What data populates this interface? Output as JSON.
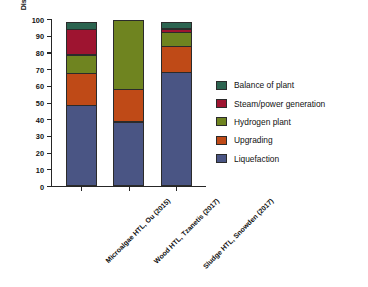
{
  "chart_data": {
    "type": "bar",
    "variant": "stacked-vertical",
    "title": "",
    "xlabel": "",
    "ylabel": "Distribution of Total Capital Investment (%)",
    "ylim": [
      0,
      100
    ],
    "yticks": [
      0,
      10,
      20,
      30,
      40,
      50,
      60,
      70,
      80,
      90,
      100
    ],
    "ytick_labels": [
      "0",
      "10",
      "20",
      "30",
      "40",
      "50",
      "60",
      "70",
      "80",
      "90",
      "100"
    ],
    "grid": false,
    "legend_position": "right",
    "categories": [
      "Microalgae HTL, Ou (2015)",
      "Wood HTL, Tzanetis (2017)",
      "Sludge HTL, Snowden (2017)"
    ],
    "series": [
      {
        "name": "Liquefaction",
        "color": "#4a5584",
        "values": [
          48.5,
          38.5,
          68.0
        ]
      },
      {
        "name": "Upgrading",
        "color": "#bf4a17",
        "values": [
          19.5,
          20.0,
          16.0
        ]
      },
      {
        "name": "Hydrogen plant",
        "color": "#6f8420",
        "values": [
          11.5,
          41.5,
          9.0
        ]
      },
      {
        "name": "Steam/power generation",
        "color": "#9e1430",
        "values": [
          15.5,
          0.0,
          2.5
        ]
      },
      {
        "name": "Balance of plant",
        "color": "#2c6450",
        "values": [
          5.0,
          0.0,
          4.5
        ]
      }
    ],
    "legend_order": [
      "Balance of plant",
      "Steam/power generation",
      "Hydrogen plant",
      "Upgrading",
      "Liquefaction"
    ],
    "cumulative_boundaries": [
      [
        48.5,
        68.0,
        79.5,
        95.0,
        100.0
      ],
      [
        38.5,
        58.5,
        100.0,
        100.0,
        100.0
      ],
      [
        68.0,
        84.0,
        93.0,
        95.5,
        100.0
      ]
    ]
  }
}
